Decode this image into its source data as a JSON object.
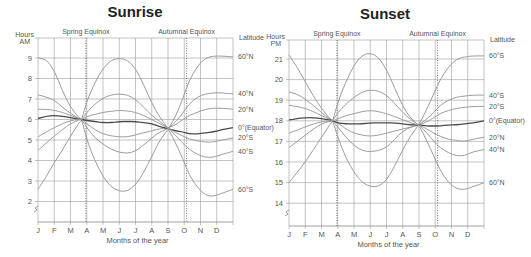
{
  "chart_data": [
    {
      "type": "line",
      "title": "Sunrise",
      "xlabel": "Months of the year",
      "ylabel": "Hours AM",
      "right_label": "Latitude",
      "annotations": [
        "Spring Equinox",
        "Autumnal Equinox"
      ],
      "categories": [
        "J",
        "F",
        "M",
        "A",
        "M",
        "J",
        "J",
        "A",
        "S",
        "O",
        "N",
        "D"
      ],
      "yticks": [
        2,
        3,
        4,
        5,
        6,
        7,
        8,
        9
      ],
      "ylim": [
        1,
        10
      ],
      "grid": true,
      "x": [
        0,
        0.5,
        1,
        1.5,
        2,
        2.5,
        2.7,
        3,
        3.5,
        4,
        4.5,
        5,
        5.5,
        6,
        6.5,
        7,
        7.5,
        8,
        8.5,
        8.9,
        9.3,
        9.8,
        10.3,
        10.8,
        11.3,
        11.8
      ],
      "series": [
        {
          "name": "60°N",
          "values": [
            9.0,
            8.95,
            8.4,
            7.4,
            6.6,
            6.1,
            6.0,
            5.0,
            4.0,
            3.2,
            2.7,
            2.5,
            2.5,
            2.8,
            3.4,
            4.2,
            5.0,
            5.5,
            6.2,
            7.0,
            7.9,
            8.6,
            9.0,
            9.1,
            9.1,
            9.05
          ],
          "mirror": true
        },
        {
          "name": "40°N",
          "values": [
            7.2,
            7.1,
            6.95,
            6.6,
            6.3,
            6.05,
            6.0,
            5.6,
            5.1,
            4.8,
            4.55,
            4.4,
            4.35,
            4.45,
            4.75,
            5.1,
            5.4,
            5.55,
            5.9,
            6.3,
            6.75,
            7.1,
            7.25,
            7.3,
            7.3,
            7.25
          ],
          "mirror": true
        },
        {
          "name": "20°N",
          "values": [
            6.5,
            6.5,
            6.45,
            6.35,
            6.2,
            6.05,
            6.0,
            5.8,
            5.5,
            5.3,
            5.2,
            5.15,
            5.15,
            5.25,
            5.35,
            5.45,
            5.55,
            5.58,
            5.75,
            6.0,
            6.2,
            6.35,
            6.5,
            6.55,
            6.55,
            6.5
          ],
          "mirror": true
        },
        {
          "name": "0°(Equator)",
          "values": [
            6.05,
            6.15,
            6.2,
            6.15,
            6.1,
            6.02,
            6.0,
            5.95,
            5.9,
            5.85,
            5.85,
            5.9,
            5.9,
            5.9,
            5.85,
            5.8,
            5.65,
            5.55,
            5.45,
            5.4,
            5.3,
            5.3,
            5.35,
            5.4,
            5.5,
            5.6
          ]
        },
        {
          "name": "20°S",
          "values": [
            5.15,
            5.4,
            5.6,
            5.8,
            5.95,
            6.0,
            6.0,
            6.15,
            6.25,
            6.35,
            6.4,
            6.45,
            6.42,
            6.35,
            6.2,
            6.0,
            5.8,
            5.58,
            5.35,
            5.2,
            5.05,
            4.95,
            4.9,
            4.9,
            5.0,
            5.1
          ]
        },
        {
          "name": "40°S",
          "values": [
            4.5,
            4.85,
            5.2,
            5.5,
            5.8,
            5.98,
            6.0,
            6.35,
            6.75,
            7.05,
            7.2,
            7.25,
            7.2,
            7.0,
            6.6,
            6.2,
            5.9,
            5.58,
            5.2,
            4.85,
            4.55,
            4.3,
            4.15,
            4.15,
            4.3,
            4.45
          ]
        },
        {
          "name": "60°S",
          "values": [
            2.6,
            3.2,
            3.9,
            4.5,
            5.2,
            5.8,
            6.0,
            6.9,
            7.8,
            8.5,
            8.9,
            9.0,
            8.9,
            8.5,
            7.7,
            6.8,
            6.1,
            5.58,
            4.8,
            4.1,
            3.3,
            2.7,
            2.3,
            2.25,
            2.4,
            2.6
          ]
        }
      ]
    },
    {
      "type": "line",
      "title": "Sunset",
      "xlabel": "Months of the year",
      "ylabel": "Hours PM",
      "right_label": "Latitude",
      "annotations": [
        "Spring Equinox",
        "Autumnal Equinox"
      ],
      "categories": [
        "J",
        "F",
        "M",
        "A",
        "M",
        "J",
        "J",
        "A",
        "S",
        "O",
        "N",
        "D"
      ],
      "yticks": [
        14,
        15,
        16,
        17,
        18,
        19,
        20,
        21
      ],
      "ylim": [
        13,
        22
      ],
      "grid": true,
      "x": [
        0,
        0.5,
        1,
        1.5,
        2,
        2.5,
        2.7,
        3,
        3.5,
        4,
        4.5,
        5,
        5.5,
        6,
        6.5,
        7,
        7.5,
        8,
        8.5,
        8.9,
        9.3,
        9.8,
        10.3,
        10.8,
        11.3,
        11.8
      ],
      "series": [
        {
          "name": "60°S",
          "values": [
            21.2,
            20.6,
            19.9,
            19.2,
            18.6,
            18.1,
            18.0,
            17.2,
            16.2,
            15.5,
            15.0,
            14.8,
            14.8,
            15.1,
            15.8,
            16.6,
            17.3,
            17.8,
            18.6,
            19.3,
            20.0,
            20.6,
            21.0,
            21.1,
            21.15,
            21.15
          ]
        },
        {
          "name": "40°S",
          "values": [
            19.4,
            19.3,
            19.05,
            18.75,
            18.4,
            18.1,
            18.0,
            17.7,
            17.2,
            16.8,
            16.55,
            16.5,
            16.55,
            16.7,
            17.1,
            17.5,
            17.7,
            17.8,
            18.1,
            18.4,
            18.75,
            19.0,
            19.15,
            19.2,
            19.25,
            19.25
          ]
        },
        {
          "name": "20°S",
          "values": [
            18.75,
            18.7,
            18.6,
            18.45,
            18.25,
            18.08,
            18.0,
            17.9,
            17.6,
            17.4,
            17.3,
            17.25,
            17.3,
            17.4,
            17.5,
            17.6,
            17.7,
            17.8,
            17.95,
            18.15,
            18.35,
            18.5,
            18.6,
            18.65,
            18.7,
            18.7
          ]
        },
        {
          "name": "0°(Equator)",
          "values": [
            18.05,
            18.1,
            18.15,
            18.15,
            18.1,
            18.05,
            18.0,
            17.9,
            17.85,
            17.85,
            17.85,
            17.9,
            17.9,
            17.9,
            17.9,
            17.85,
            17.8,
            17.8,
            17.75,
            17.75,
            17.75,
            17.8,
            17.8,
            17.85,
            17.9,
            18.0
          ]
        },
        {
          "name": "20°N",
          "values": [
            17.4,
            17.55,
            17.7,
            17.85,
            17.95,
            18.0,
            18.0,
            18.1,
            18.25,
            18.35,
            18.45,
            18.5,
            18.45,
            18.35,
            18.2,
            18.05,
            17.9,
            17.8,
            17.6,
            17.4,
            17.25,
            17.1,
            17.05,
            17.0,
            17.1,
            17.2
          ]
        },
        {
          "name": "40°N",
          "values": [
            16.7,
            17.0,
            17.3,
            17.6,
            17.85,
            17.98,
            18.0,
            18.4,
            18.8,
            19.15,
            19.4,
            19.5,
            19.45,
            19.25,
            18.85,
            18.4,
            18.05,
            17.8,
            17.4,
            17.0,
            16.7,
            16.45,
            16.3,
            16.3,
            16.5,
            16.6
          ]
        },
        {
          "name": "60°N",
          "values": [
            15.0,
            15.5,
            16.0,
            16.6,
            17.2,
            17.8,
            18.0,
            18.9,
            19.9,
            20.7,
            21.2,
            21.3,
            21.1,
            20.5,
            19.6,
            18.7,
            18.1,
            17.8,
            17.0,
            16.3,
            15.6,
            15.0,
            14.7,
            14.65,
            14.8,
            15.0
          ]
        }
      ]
    }
  ],
  "labels": {
    "sunrise_title": "Sunrise",
    "sunset_title": "Sunset",
    "spring": "Spring Equinox",
    "autumn": "Autumnal Equinox",
    "hours": "Hours",
    "am": "AM",
    "pm": "PM",
    "latitude": "Latitude",
    "months_label": "Months of the year"
  }
}
